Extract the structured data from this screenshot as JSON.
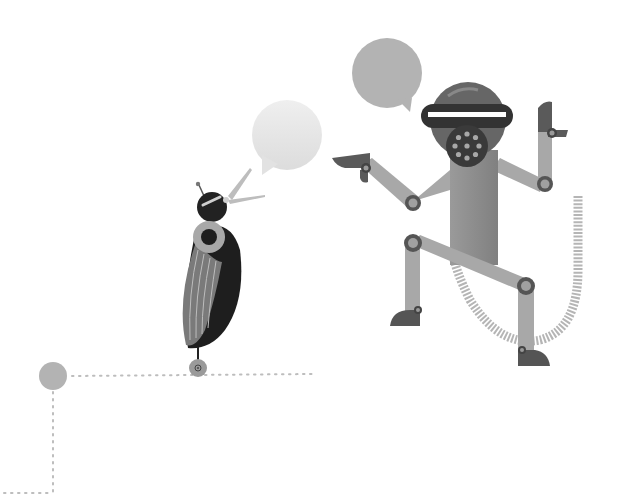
{
  "scene": {
    "title": "Bird and robot monkey conversation illustration",
    "palette": {
      "background": "#ffffff",
      "bubble_light": "#e6e6e6",
      "bubble_mid": "#b3b3b3",
      "limb": "#a6a6a6",
      "body": "#8c8c8c",
      "dark": "#3a3a3a",
      "darker": "#1f1f1f",
      "joint_ring": "#555555",
      "dot_line": "#b8b8b8",
      "node": "#b0b0b0"
    },
    "elements": [
      {
        "name": "bird",
        "description": "dark bird with ringed eye-collar and striped wing, open beak"
      },
      {
        "name": "bird-speech-bubble",
        "description": "light gray round speech bubble"
      },
      {
        "name": "robot-monkey",
        "description": "gray robot monkey with visor, round mask, jointed limbs and coiled tail"
      },
      {
        "name": "robot-speech-bubble",
        "description": "mid gray round speech bubble"
      },
      {
        "name": "dotted-path",
        "description": "dotted connector line with circular node"
      }
    ]
  }
}
